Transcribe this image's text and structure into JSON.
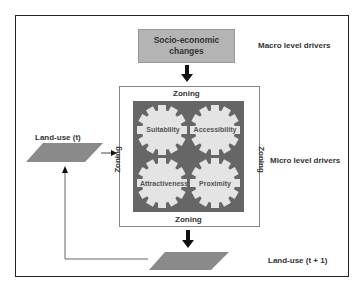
{
  "diagram": {
    "top_box": {
      "line1": "Socio-economic",
      "line2": "changes"
    },
    "macro_label": "Macro level drivers",
    "micro_label": "Micro level drivers",
    "zoning": {
      "top": "Zoning",
      "bottom": "Zoning",
      "left": "Zoning",
      "right": "Zoning"
    },
    "gears": [
      "Suitability",
      "Accessibility",
      "Attractiveness",
      "Proximity"
    ],
    "landuse_t": "Land-use (t)",
    "landuse_t1": "Land-use (t + 1)",
    "colors": {
      "box_fill": "#b4b4b4",
      "gear_bg": "#666666",
      "gear_fill": "#e4e4e4",
      "landuse_fill": "#8a8a8a"
    }
  }
}
